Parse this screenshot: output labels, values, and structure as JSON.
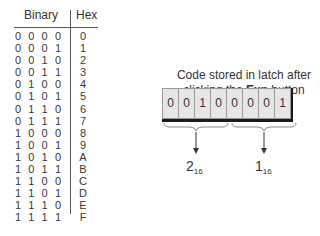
{
  "table": {
    "headers": {
      "binary": "Binary",
      "hex": "Hex"
    },
    "rows": [
      {
        "bits": [
          "0",
          "0",
          "0",
          "0"
        ],
        "hex": "0"
      },
      {
        "bits": [
          "0",
          "0",
          "0",
          "1"
        ],
        "hex": "1"
      },
      {
        "bits": [
          "0",
          "0",
          "1",
          "0"
        ],
        "hex": "2"
      },
      {
        "bits": [
          "0",
          "0",
          "1",
          "1"
        ],
        "hex": "3"
      },
      {
        "bits": [
          "0",
          "1",
          "0",
          "0"
        ],
        "hex": "4"
      },
      {
        "bits": [
          "0",
          "1",
          "0",
          "1"
        ],
        "hex": "5"
      },
      {
        "bits": [
          "0",
          "1",
          "1",
          "0"
        ],
        "hex": "6"
      },
      {
        "bits": [
          "0",
          "1",
          "1",
          "1"
        ],
        "hex": "7"
      },
      {
        "bits": [
          "1",
          "0",
          "0",
          "0"
        ],
        "hex": "8"
      },
      {
        "bits": [
          "1",
          "0",
          "0",
          "1"
        ],
        "hex": "9"
      },
      {
        "bits": [
          "1",
          "0",
          "1",
          "0"
        ],
        "hex": "A"
      },
      {
        "bits": [
          "1",
          "0",
          "1",
          "1"
        ],
        "hex": "B"
      },
      {
        "bits": [
          "1",
          "1",
          "0",
          "0"
        ],
        "hex": "C"
      },
      {
        "bits": [
          "1",
          "1",
          "0",
          "1"
        ],
        "hex": "D"
      },
      {
        "bits": [
          "1",
          "1",
          "1",
          "0"
        ],
        "hex": "E"
      },
      {
        "bits": [
          "1",
          "1",
          "1",
          "1"
        ],
        "hex": "F"
      }
    ]
  },
  "caption": {
    "line1": "Code stored in latch after",
    "line2_prefix": "clicking the ",
    "line2_bold": "Exp",
    "line2_suffix": " button"
  },
  "latch": {
    "bits": [
      "0",
      "0",
      "1",
      "0",
      "0",
      "0",
      "0",
      "1"
    ]
  },
  "nibbles": [
    {
      "value": "2",
      "base": "16"
    },
    {
      "value": "1",
      "base": "16"
    }
  ]
}
